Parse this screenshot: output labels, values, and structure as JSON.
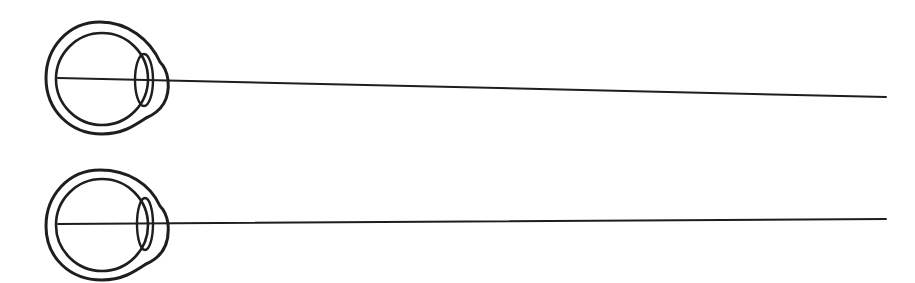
{
  "diagram": {
    "type": "eye-sight-line-comparison",
    "stroke_color": "#1e1e1e",
    "background": "#ffffff",
    "eyes": [
      {
        "id": "top",
        "center": [
          102,
          78
        ],
        "outer_radius": 54,
        "inner_radius": 46,
        "lens": {
          "cx": 144,
          "cy": 80,
          "rx": 9,
          "ry": 26
        },
        "sight_line": {
          "x1": 58,
          "y1": 78,
          "x2": 886,
          "y2": 97
        }
      },
      {
        "id": "bottom",
        "center": [
          102,
          225
        ],
        "outer_radius": 54,
        "inner_radius": 46,
        "lens": {
          "cx": 145,
          "cy": 224,
          "rx": 8,
          "ry": 26
        },
        "sight_line": {
          "x1": 58,
          "y1": 224,
          "x2": 886,
          "y2": 219
        }
      }
    ]
  }
}
